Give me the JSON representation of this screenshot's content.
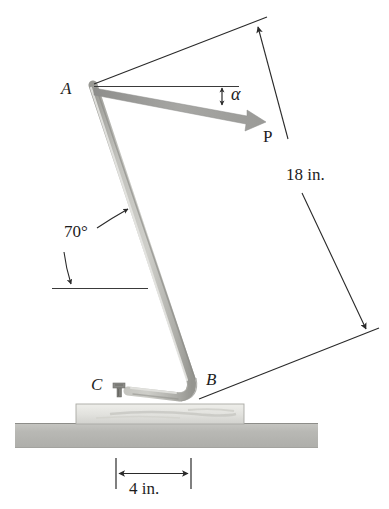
{
  "figure": {
    "type": "engineering-mechanics-free-body-diagram",
    "background_color": "#ffffff"
  },
  "labels": {
    "point_a": "A",
    "point_b": "B",
    "point_c": "C",
    "force_p": "P",
    "angle_alpha": "α",
    "angle_70": "70°",
    "dimension_18": "18 in.",
    "dimension_4": "4 in."
  },
  "colors": {
    "line": "#2a2a2a",
    "rod_light": "#d6d6d2",
    "rod_mid": "#b9b9b4",
    "rod_dark": "#9a9a95",
    "arrow_gray": "#9e9e9c",
    "ground": "#b7b7b3",
    "ground_edge": "#8d8d89",
    "block_fill": "#e2e2de",
    "block_edge": "#a9a9a4",
    "text": "#1d1d1d"
  },
  "geometry": {
    "point_a": {
      "x": 92,
      "y": 84
    },
    "point_b": {
      "x": 192,
      "y": 386
    },
    "point_c": {
      "x": 119,
      "y": 390
    },
    "rod_length_in": 18,
    "base_offset_in": 4,
    "rod_angle_deg": 70,
    "force_angle_alpha_deg": 12
  },
  "dimensions": [
    {
      "name": "rod-length",
      "label": "18 in.",
      "value": 18,
      "unit": "in."
    },
    {
      "name": "base-offset",
      "label": "4 in.",
      "value": 4,
      "unit": "in."
    }
  ],
  "angles": [
    {
      "name": "rod-inclination",
      "label": "70°",
      "value": 70,
      "unit": "deg"
    },
    {
      "name": "force-inclination",
      "label": "α",
      "value": null,
      "unit": "deg"
    }
  ],
  "forces": [
    {
      "name": "applied-force",
      "label": "P",
      "at": "A",
      "direction": "down-right"
    }
  ]
}
